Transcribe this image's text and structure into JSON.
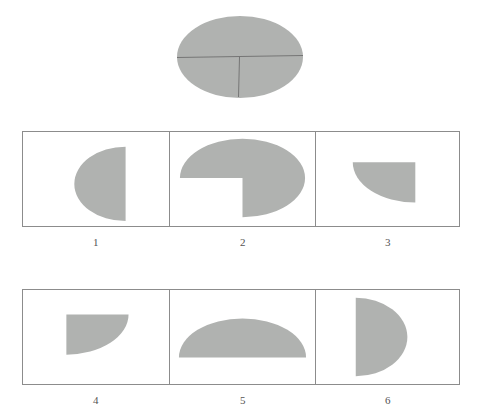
{
  "puzzle": {
    "type": "shape-decomposition",
    "colors": {
      "shape_fill": "#b0b2b0",
      "cut_line": "#6e6e6e",
      "frame_border": "#8c8c8c",
      "label_text": "#545454",
      "background": "#ffffff"
    },
    "prompt": {
      "name": "ellipse-with-cut-lines",
      "shape": "ellipse",
      "width": 126,
      "height": 82,
      "cut_lines": [
        {
          "name": "horizontal-diameter",
          "orientation": "horizontal",
          "from": "left-edge",
          "to": "right-edge"
        },
        {
          "name": "vertical-lower-radius",
          "orientation": "vertical",
          "from": "center",
          "to": "bottom-edge"
        }
      ],
      "piece_count": 3
    },
    "options": [
      {
        "label": "1",
        "name": "option-1",
        "shape": "half-ellipse-left",
        "description": "Half ellipse with curved side facing left and flat vertical edge on the right"
      },
      {
        "label": "2",
        "name": "option-2",
        "shape": "ellipse-with-quarter-notch",
        "description": "Full ellipse with a quarter section removed from the lower left"
      },
      {
        "label": "3",
        "name": "option-3",
        "shape": "quarter-ellipse-upper-right",
        "description": "Quarter ellipse with flat top edge and flat right edge, curving toward lower left"
      },
      {
        "label": "4",
        "name": "option-4",
        "shape": "quarter-ellipse-upper-left",
        "description": "Quarter ellipse with flat top edge and flat left edge, curving toward lower right"
      },
      {
        "label": "5",
        "name": "option-5",
        "shape": "half-ellipse-top",
        "description": "Top half of an ellipse with flat horizontal edge along the bottom"
      },
      {
        "label": "6",
        "name": "option-6",
        "shape": "half-ellipse-right",
        "description": "Half ellipse with flat vertical edge on the left and curved side facing right"
      }
    ]
  }
}
